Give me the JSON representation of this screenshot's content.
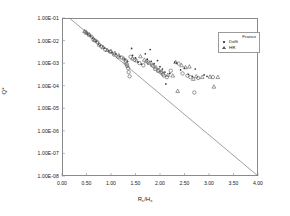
{
  "chart_data": {
    "type": "scatter",
    "title": "",
    "xlabel": "Rc/Hs",
    "xlabel_base": "R",
    "xlabel_sub1": "c",
    "xlabel_mid": "/H",
    "xlabel_sub2": "s",
    "ylabel": "Q*",
    "xlim": [
      0.0,
      4.0
    ],
    "ylim": [
      1e-08,
      0.1
    ],
    "yscale": "log",
    "grid": false,
    "legend_position": "top-right",
    "xticks": [
      "0.00",
      "0.50",
      "1.00",
      "1.50",
      "2.00",
      "2.50",
      "3.00",
      "3.50",
      "4.00"
    ],
    "xtick_values": [
      0.0,
      0.5,
      1.0,
      1.5,
      2.0,
      2.5,
      3.0,
      3.5,
      4.0
    ],
    "yticks": [
      "1.00E-01",
      "1.00E-02",
      "1.00E-03",
      "1.00E-04",
      "1.00E-05",
      "1.00E-06",
      "1.00E-07",
      "1.00E-08"
    ],
    "ytick_values": [
      0.1,
      0.01,
      0.001,
      0.0001,
      1e-05,
      1e-06,
      1e-07,
      1e-08
    ],
    "legend_title": "Franco",
    "trendline": {
      "name": "trend",
      "x": [
        0.15,
        4.0
      ],
      "y": [
        0.1,
        1e-08
      ],
      "color": "#777777"
    },
    "series": [
      {
        "name": "Franco",
        "marker": "dot",
        "color": "#333333",
        "points": [
          [
            0.52,
            0.02
          ],
          [
            0.58,
            0.016
          ],
          [
            0.62,
            0.013
          ],
          [
            0.7,
            0.009
          ],
          [
            0.74,
            0.007
          ],
          [
            0.78,
            0.006
          ],
          [
            0.86,
            0.0046
          ],
          [
            0.95,
            0.0036
          ],
          [
            1.02,
            0.003
          ],
          [
            1.1,
            0.0026
          ],
          [
            1.18,
            0.002
          ],
          [
            1.28,
            0.0015
          ],
          [
            1.34,
            0.0012
          ],
          [
            1.42,
            0.0045
          ],
          [
            1.44,
            0.0022
          ],
          [
            1.5,
            0.0017
          ],
          [
            1.55,
            0.0011
          ],
          [
            1.62,
            0.0009
          ],
          [
            1.7,
            0.0026
          ],
          [
            1.74,
            0.0015
          ],
          [
            1.8,
            0.004
          ],
          [
            1.82,
            0.0012
          ],
          [
            1.88,
            0.00095
          ],
          [
            1.95,
            0.0013
          ],
          [
            2.0,
            0.0007
          ],
          [
            2.05,
            0.00055
          ],
          [
            2.1,
            0.0004
          ],
          [
            2.12,
            0.00012
          ],
          [
            2.2,
            0.00035
          ],
          [
            2.3,
            0.0011
          ],
          [
            2.34,
            0.001
          ],
          [
            2.42,
            0.0005
          ],
          [
            2.5,
            0.0006
          ],
          [
            2.58,
            0.00032
          ],
          [
            2.66,
            0.00026
          ],
          [
            2.72,
            0.00055
          ],
          [
            2.9,
            0.0003
          ],
          [
            2.96,
            0.00026
          ]
        ]
      },
      {
        "name": "Delft",
        "marker": "circle",
        "color": "#555555",
        "points": [
          [
            0.48,
            0.024
          ],
          [
            0.54,
            0.019
          ],
          [
            0.6,
            0.015
          ],
          [
            0.68,
            0.01
          ],
          [
            0.72,
            0.0085
          ],
          [
            0.8,
            0.0055
          ],
          [
            0.88,
            0.004
          ],
          [
            0.98,
            0.0032
          ],
          [
            1.06,
            0.0024
          ],
          [
            1.14,
            0.0019
          ],
          [
            1.3,
            0.0013
          ],
          [
            1.3,
            0.0011
          ],
          [
            1.32,
            0.0009
          ],
          [
            1.33,
            0.00075
          ],
          [
            1.35,
            0.0006
          ],
          [
            1.36,
            0.0004
          ],
          [
            1.38,
            0.00026
          ],
          [
            1.4,
            0.0019
          ],
          [
            1.48,
            0.0014
          ],
          [
            1.58,
            0.001
          ],
          [
            1.66,
            0.0008
          ],
          [
            1.76,
            0.0011
          ],
          [
            1.86,
            0.00075
          ],
          [
            1.9,
            0.00055
          ],
          [
            1.96,
            0.00045
          ],
          [
            2.02,
            0.00038
          ],
          [
            2.06,
            0.00032
          ],
          [
            2.08,
            0.00028
          ],
          [
            2.14,
            0.00024
          ],
          [
            2.22,
            0.00046
          ],
          [
            2.38,
            0.00095
          ],
          [
            2.46,
            0.00035
          ],
          [
            2.56,
            0.00028
          ],
          [
            2.62,
            0.00024
          ],
          [
            2.7,
            5e-05
          ],
          [
            2.78,
            0.00022
          ],
          [
            3.08,
            0.00024
          ]
        ]
      },
      {
        "name": "HR",
        "marker": "triangle",
        "color": "#555555",
        "points": [
          [
            0.46,
            0.026
          ],
          [
            0.5,
            0.022
          ],
          [
            0.56,
            0.018
          ],
          [
            0.64,
            0.012
          ],
          [
            0.66,
            0.0105
          ],
          [
            0.76,
            0.0065
          ],
          [
            0.84,
            0.005
          ],
          [
            0.92,
            0.0038
          ],
          [
            1.0,
            0.0034
          ],
          [
            1.08,
            0.0028
          ],
          [
            1.16,
            0.0022
          ],
          [
            1.22,
            0.0018
          ],
          [
            1.26,
            0.0016
          ],
          [
            1.44,
            0.0016
          ],
          [
            1.52,
            0.0013
          ],
          [
            1.6,
            0.002
          ],
          [
            1.68,
            0.0014
          ],
          [
            1.72,
            0.0012
          ],
          [
            1.78,
            0.001
          ],
          [
            1.84,
            0.00085
          ],
          [
            1.92,
            0.00065
          ],
          [
            1.98,
            0.0005
          ],
          [
            2.04,
            0.00042
          ],
          [
            2.16,
            0.0003
          ],
          [
            2.26,
            0.00028
          ],
          [
            2.32,
            0.0011
          ],
          [
            2.36,
            5.8e-05
          ],
          [
            2.44,
            0.0008
          ],
          [
            2.52,
            0.00065
          ],
          [
            2.6,
            0.0007
          ],
          [
            2.68,
            0.0002
          ],
          [
            2.74,
            0.00026
          ],
          [
            2.86,
            0.00024
          ],
          [
            3.02,
            0.00025
          ],
          [
            3.1,
            9e-05
          ],
          [
            3.18,
            0.00024
          ]
        ]
      }
    ]
  },
  "legend": {
    "title": "Franco",
    "entries": [
      {
        "label": "Delft",
        "marker": "dot"
      },
      {
        "label": "HR",
        "marker": "triangle"
      }
    ]
  }
}
